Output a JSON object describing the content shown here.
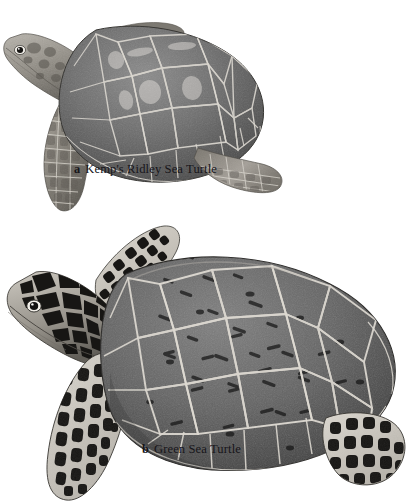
{
  "plate": {
    "background_color": "#ffffff",
    "medium": "graphite-pencil-illustration",
    "subject": "sea-turtles-dorsal-lateral-view"
  },
  "figures": [
    {
      "key": "a",
      "label": "a",
      "name": "Kemp's Ridley Sea Turtle",
      "icon": "sea-turtle-icon",
      "description": "Smaller rounded carapace, uniform mid-gray scutes with pale borders, lightly mottled flippers, plain gray head",
      "carapace_tone": "#6d6d6d",
      "scute_border_color": "#d8d5cf",
      "flipper_contrast": "low"
    },
    {
      "key": "b",
      "label": "b",
      "name": "Green Sea Turtle",
      "icon": "sea-turtle-icon",
      "description": "Larger elongated carapace with dark streaked scutes, bold black-and-white reticulated flippers and head scales",
      "carapace_tone": "#5c5c5c",
      "scute_border_color": "#ddd9d2",
      "flipper_contrast": "high"
    }
  ],
  "colors": {
    "ink": "#17151a",
    "paper": "#ffffff",
    "mid_gray": "#6d6d6d",
    "dark_gray": "#2a2a2a",
    "light_gray": "#cfcbc4",
    "highlight": "#efece6"
  }
}
